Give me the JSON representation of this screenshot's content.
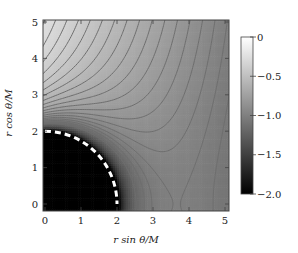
{
  "chart_data": {
    "type": "heatmap",
    "subtype": "contour-density",
    "title": "",
    "xlabel": "r sin θ / M",
    "ylabel": "r cos θ / M",
    "xlim": [
      -0.08,
      5.1
    ],
    "ylim": [
      -0.18,
      5.1
    ],
    "xticks": [
      0,
      1,
      2,
      3,
      4,
      5
    ],
    "yticks": [
      0,
      1,
      2,
      3,
      4,
      5
    ],
    "xtick_labels": [
      "0",
      "1",
      "2",
      "3",
      "4",
      "5"
    ],
    "ytick_labels": [
      "0",
      "1",
      "2",
      "3",
      "4",
      "5"
    ],
    "grid": false,
    "colorbar": {
      "range": [
        -2.0,
        0
      ],
      "ticks": [
        0,
        -0.5,
        -1.0,
        -1.5,
        -2.0
      ],
      "tick_labels": [
        "0",
        "−0.5",
        "−1.0",
        "−1.5",
        "−2.0"
      ],
      "colormap": "grayscale (black = −2.0, white = 0)",
      "position": "right"
    },
    "horizon": {
      "radius": 2,
      "style": "white dashed quarter circle",
      "label": "r = 2M"
    },
    "model": {
      "description": "approx field: 0.5*ln(1-2/r) - 0.165*r*sinθ",
      "horizon_coeff": 0.5,
      "linear_coeff": 0.165
    },
    "contour_levels": [
      -0.05,
      -0.1,
      -0.15,
      -0.2,
      -0.25,
      -0.3,
      -0.35,
      -0.4,
      -0.45,
      -0.5,
      -0.55,
      -0.6,
      -0.65,
      -0.7,
      -0.75,
      -0.8,
      -0.85,
      -0.9,
      -0.95,
      -1.0,
      -1.05,
      -1.1,
      -1.15,
      -1.2
    ],
    "contour_color": "#6e6e6e"
  },
  "plot": {
    "x_axis_label_text": "r sin θ/M",
    "y_axis_label_text": "r cos θ/M"
  }
}
